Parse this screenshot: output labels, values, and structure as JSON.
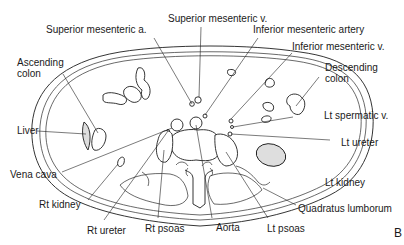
{
  "figure": {
    "type": "anatomical cross-section",
    "panel_label": "B",
    "colors": {
      "line": "#1e1e1e",
      "shaded_organ": "#dedede",
      "background": "#ffffff"
    }
  },
  "labels": {
    "superior_mesenteric_a": "Superior mesenteric a.",
    "superior_mesenteric_v": "Superior mesenteric v.",
    "inferior_mesenteric_artery": "Inferior mesenteric artery",
    "inferior_mesenteric_v": "Inferior mesenteric v.",
    "ascending_colon": [
      "Ascending",
      "colon"
    ],
    "descending_colon": [
      "Descending",
      "colon"
    ],
    "liver": "Liver",
    "lt_spermatic_v": "Lt spermatic v.",
    "vena_cava": "Vena cava",
    "lt_ureter": "Lt ureter",
    "rt_kidney": "Rt kidney",
    "lt_kidney": "Lt kidney",
    "quadratus_lumborum": "Quadratus lumborum",
    "rt_ureter": "Rt ureter",
    "rt_psoas": "Rt psoas",
    "aorta": "Aorta",
    "lt_psoas": "Lt psoas"
  }
}
